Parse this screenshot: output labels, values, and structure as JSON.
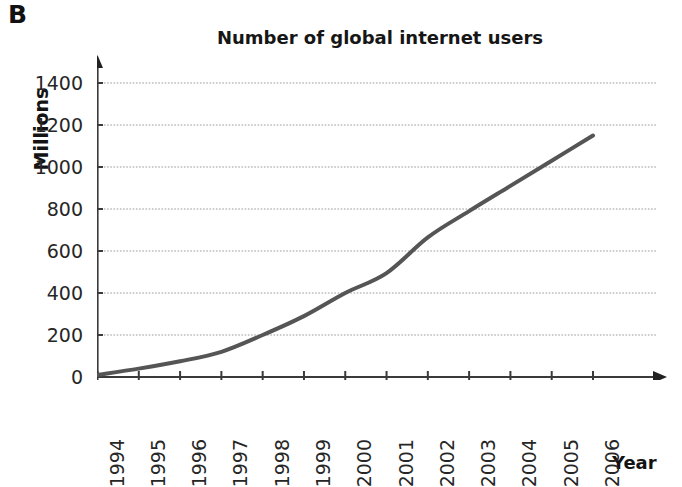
{
  "panel": {
    "letter": "B"
  },
  "chart_data": {
    "type": "line",
    "title": "Number of global internet users",
    "xlabel": "Year",
    "ylabel": "Millions",
    "x": [
      1994,
      1995,
      1996,
      1997,
      1998,
      1999,
      2000,
      2001,
      2002,
      2003,
      2004,
      2005,
      2006
    ],
    "categories": [
      "1994",
      "1995",
      "1996",
      "1997",
      "1998",
      "1999",
      "2000",
      "2001",
      "2002",
      "2003",
      "2004",
      "2005",
      "2006"
    ],
    "values": [
      10,
      40,
      75,
      120,
      200,
      290,
      400,
      495,
      665,
      790,
      910,
      1030,
      1150
    ],
    "series": [
      {
        "name": "Global internet users",
        "values": [
          10,
          40,
          75,
          120,
          200,
          290,
          400,
          495,
          665,
          790,
          910,
          1030,
          1150
        ],
        "color": "#555555"
      }
    ],
    "ylim": [
      0,
      1400
    ],
    "xlim": [
      1994,
      2006
    ],
    "yticks": [
      0,
      200,
      400,
      600,
      800,
      1000,
      1200,
      1400
    ],
    "ytick_labels": [
      "0",
      "200",
      "400",
      "600",
      "800",
      "1000",
      "1200",
      "1400"
    ],
    "xtick_labels": [
      "1994",
      "1995",
      "1996",
      "1997",
      "1998",
      "1999",
      "2000",
      "2001",
      "2002",
      "2003",
      "2004",
      "2005",
      "2006"
    ],
    "grid": "horizontal-dotted",
    "legend": "none",
    "axis_color": "#3a3a3a",
    "grid_color": "#9a9a9a",
    "line_color": "#555555",
    "line_width": 4,
    "x_axis_arrow": true,
    "y_axis_arrow": true
  }
}
